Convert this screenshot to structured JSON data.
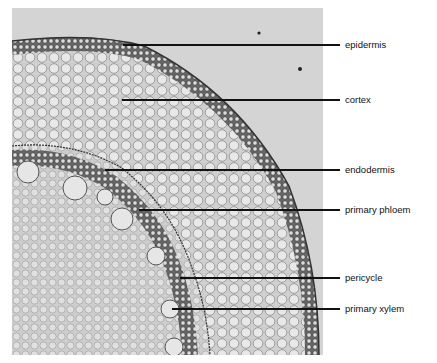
{
  "figure": {
    "labels": [
      {
        "text": "epidermis",
        "y": 45,
        "x_start": 123
      },
      {
        "text": "cortex",
        "y": 100,
        "x_start": 122
      },
      {
        "text": "endodermis",
        "y": 170,
        "x_start": 105
      },
      {
        "text": "primary phloem",
        "y": 210,
        "x_start": 139
      },
      {
        "text": "pericycle",
        "y": 278,
        "x_start": 180
      },
      {
        "text": "primary xylem",
        "y": 309,
        "x_start": 172
      }
    ]
  }
}
